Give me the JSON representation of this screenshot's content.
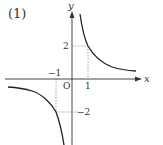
{
  "figure": {
    "problem_label": "(1)",
    "function": "y = 2/x",
    "axes": {
      "x_label": "x",
      "y_label": "y",
      "origin_label": "O"
    },
    "ticks": {
      "x_pos": "1",
      "x_neg": "−1",
      "y_pos": "2",
      "y_neg": "−2"
    },
    "marked_points": [
      {
        "x": 1,
        "y": 2
      },
      {
        "x": -1,
        "y": -2
      }
    ],
    "colors": {
      "curve": "#222222",
      "axis": "#333333",
      "guide": "#666666"
    }
  }
}
